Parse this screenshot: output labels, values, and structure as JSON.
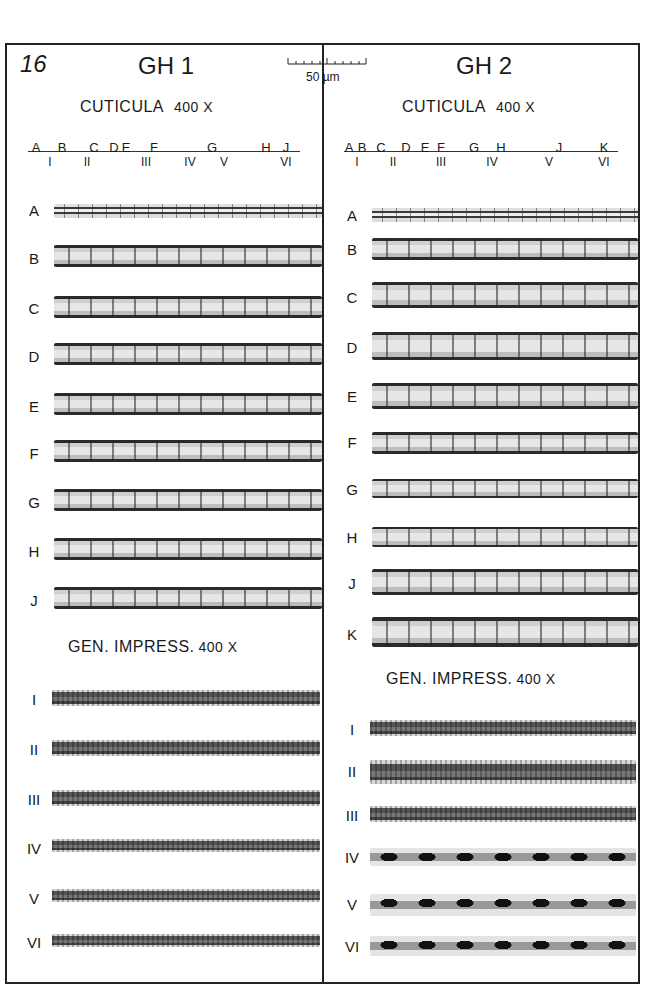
{
  "plate": {
    "number": "16",
    "scale_bar": "50 µm"
  },
  "columns": [
    {
      "title": "GH 1",
      "cuticula": {
        "title": "CUTICULA",
        "magnification": "400 X",
        "axis_upper": [
          "A",
          "B",
          "C",
          "D",
          "E",
          "F",
          "G",
          "H",
          "J"
        ],
        "axis_lower": [
          "I",
          "II",
          "III",
          "IV",
          "V",
          "VI"
        ],
        "rows": [
          "A",
          "B",
          "C",
          "D",
          "E",
          "F",
          "G",
          "H",
          "J"
        ]
      },
      "impression": {
        "title": "GEN.  IMPRESS.",
        "magnification": "400 X",
        "rows": [
          "I",
          "II",
          "III",
          "IV",
          "V",
          "VI"
        ]
      }
    },
    {
      "title": "GH 2",
      "cuticula": {
        "title": "CUTICULA",
        "magnification": "400 X",
        "axis_upper": [
          "A",
          "B",
          "C",
          "D",
          "E",
          "F",
          "G",
          "H",
          "J",
          "K"
        ],
        "axis_lower": [
          "I",
          "II",
          "III",
          "IV",
          "V",
          "VI"
        ],
        "rows": [
          "A",
          "B",
          "C",
          "D",
          "E",
          "F",
          "G",
          "H",
          "J",
          "K"
        ]
      },
      "impression": {
        "title": "GEN.  IMPRESS.",
        "magnification": "400 X",
        "rows": [
          "I",
          "II",
          "III",
          "IV",
          "V",
          "VI"
        ]
      }
    }
  ]
}
